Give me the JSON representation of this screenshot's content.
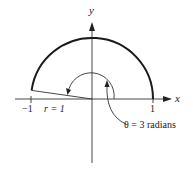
{
  "diagram": {
    "axes": {
      "x_label": "x",
      "y_label": "y"
    },
    "ticks": {
      "left": "−1",
      "right": "1"
    },
    "radius_label": "r = 1",
    "angle_label": "θ = 3 radians",
    "colors": {
      "stroke": "#222222",
      "arc": "#1a1a1a",
      "background": "#ffffff"
    }
  }
}
